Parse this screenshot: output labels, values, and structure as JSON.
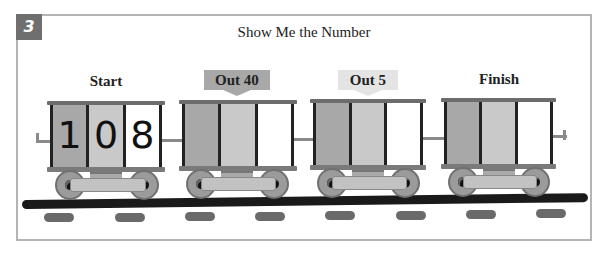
{
  "problem": {
    "number": "3",
    "title": "Show Me the Number"
  },
  "colors": {
    "badge": "#6f6f6f",
    "hundreds_cell": "#a8a8a8",
    "tens_cell": "#c9c9c9",
    "ones_cell": "#ffffff",
    "out40_tag": "#a8a8a8",
    "out5_tag": "#e4e4e4",
    "rail": "#1a1a1a"
  },
  "cars": [
    {
      "label": "Start",
      "type": "label",
      "digits": [
        "1",
        "0",
        "8"
      ]
    },
    {
      "label": "Out 40",
      "type": "tag",
      "digits": [
        "",
        "",
        ""
      ]
    },
    {
      "label": "Out 5",
      "type": "tag",
      "digits": [
        "",
        "",
        ""
      ]
    },
    {
      "label": "Finish",
      "type": "label",
      "digits": [
        "",
        "",
        ""
      ]
    }
  ]
}
